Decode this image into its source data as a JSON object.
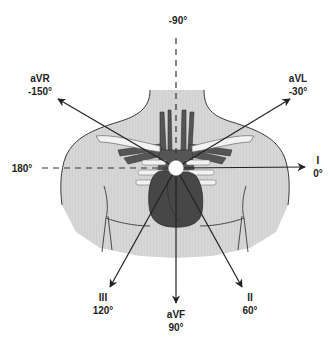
{
  "diagram": {
    "colors": {
      "torso_fill": "#d4d4d4",
      "torso_outline": "#3a3a3a",
      "heart_fill": "#4a4a4a",
      "axis_line": "#222222",
      "center_dot": "#ffffff"
    },
    "reference_axes": [
      {
        "name": "vertical",
        "label": "-90°",
        "style": "dashed"
      },
      {
        "name": "horizontal",
        "label": "180°",
        "style": "dashed"
      }
    ],
    "leads": [
      {
        "id": "I",
        "name": "I",
        "angle": "0°"
      },
      {
        "id": "aVL",
        "name": "aVL",
        "angle": "-30°"
      },
      {
        "id": "aVR",
        "name": "aVR",
        "angle": "-150°"
      },
      {
        "id": "II",
        "name": "II",
        "angle": "60°"
      },
      {
        "id": "aVF",
        "name": "aVF",
        "angle": "90°"
      },
      {
        "id": "III",
        "name": "III",
        "angle": "120°"
      }
    ]
  }
}
